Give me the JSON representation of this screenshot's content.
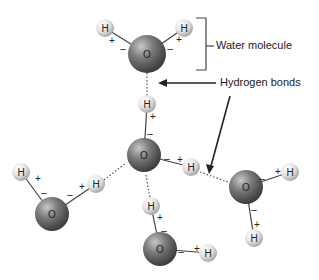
{
  "labels": {
    "water_molecule": "Water molecule",
    "hydrogen_bonds": "Hydrogen bonds"
  },
  "atoms": {
    "oxygen": "O",
    "hydrogen": "H",
    "plus": "+",
    "minus": "–"
  },
  "colors": {
    "oxygen_fill": "#6e6e6e",
    "hydrogen_fill": "#e2e2e2",
    "bond": "#444444",
    "text": "#222222"
  }
}
